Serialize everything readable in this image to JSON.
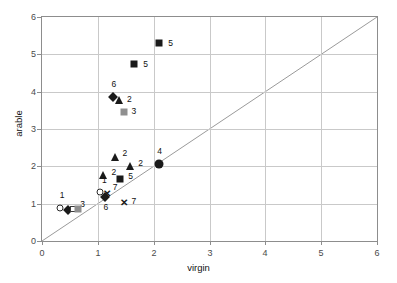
{
  "title": {
    "text": "arable vs virgin (clipped header)",
    "visible_fragment": ""
  },
  "chart_data": {
    "type": "scatter",
    "title": "",
    "xlabel": "virgin",
    "ylabel": "arable",
    "xlim": [
      0,
      6
    ],
    "ylim": [
      0,
      6
    ],
    "xticks": [
      "0",
      "1",
      "2",
      "3",
      "4",
      "5",
      "6"
    ],
    "yticks": [
      "0",
      "1",
      "2",
      "3",
      "4",
      "5",
      "6"
    ],
    "grid": true,
    "legend": "none",
    "reference_line": {
      "type": "identity",
      "equation": "y = x",
      "from": [
        0,
        0
      ],
      "to": [
        6,
        6
      ]
    },
    "points": [
      {
        "label": "5",
        "x": 2.1,
        "y": 5.3,
        "marker": "square-filled",
        "label_dx": 9,
        "label_dy": 0
      },
      {
        "label": "5",
        "x": 1.65,
        "y": 4.75,
        "marker": "square-filled",
        "label_dx": 9,
        "label_dy": 0
      },
      {
        "label": "6",
        "x": 1.28,
        "y": 3.85,
        "marker": "diamond-filled",
        "label_dx": -2,
        "label_dy": -13
      },
      {
        "label": "2",
        "x": 1.38,
        "y": 3.78,
        "marker": "triangle-filled",
        "label_dx": 8,
        "label_dy": -1
      },
      {
        "label": "3",
        "x": 1.46,
        "y": 3.45,
        "marker": "square-grey",
        "label_dx": 8,
        "label_dy": -1
      },
      {
        "label": "2",
        "x": 1.3,
        "y": 2.25,
        "marker": "triangle-filled",
        "label_dx": 8,
        "label_dy": -4
      },
      {
        "label": "2",
        "x": 1.58,
        "y": 2.0,
        "marker": "triangle-filled",
        "label_dx": 8,
        "label_dy": -3
      },
      {
        "label": "2",
        "x": 1.1,
        "y": 1.76,
        "marker": "triangle-filled",
        "label_dx": 8,
        "label_dy": -3
      },
      {
        "label": "5",
        "x": 1.4,
        "y": 1.66,
        "marker": "square-filled",
        "label_dx": 8,
        "label_dy": -3
      },
      {
        "label": "4",
        "x": 2.1,
        "y": 2.05,
        "marker": "circle-filled",
        "label_dx": -2,
        "label_dy": -13
      },
      {
        "label": "1",
        "x": 1.04,
        "y": 1.3,
        "marker": "circle-open",
        "label_dx": 2,
        "label_dy": -12
      },
      {
        "label": "7",
        "x": 1.16,
        "y": 1.28,
        "marker": "cross",
        "label_dx": 6,
        "label_dy": -6
      },
      {
        "label": "6",
        "x": 1.12,
        "y": 1.18,
        "marker": "diamond-filled",
        "label_dx": -1,
        "label_dy": 10
      },
      {
        "label": "7",
        "x": 1.46,
        "y": 1.04,
        "marker": "cross",
        "label_dx": 8,
        "label_dy": -1
      },
      {
        "label": "1",
        "x": 0.32,
        "y": 0.88,
        "marker": "circle-open",
        "label_dx": 0,
        "label_dy": -13
      },
      {
        "label": "",
        "x": 0.46,
        "y": 0.82,
        "marker": "diamond-filled",
        "label_dx": 0,
        "label_dy": 0
      },
      {
        "label": "3",
        "x": 0.56,
        "y": 0.86,
        "marker": "square-open",
        "label_dx": 7,
        "label_dy": -5
      },
      {
        "label": "",
        "x": 0.64,
        "y": 0.85,
        "marker": "square-grey",
        "label_dx": 0,
        "label_dy": 0
      }
    ],
    "marker_legend_meaning": {
      "1": "circle-open",
      "2": "triangle-filled",
      "3": "square-grey / square-open",
      "4": "circle-filled",
      "5": "square-filled",
      "6": "diamond-filled",
      "7": "cross"
    }
  }
}
